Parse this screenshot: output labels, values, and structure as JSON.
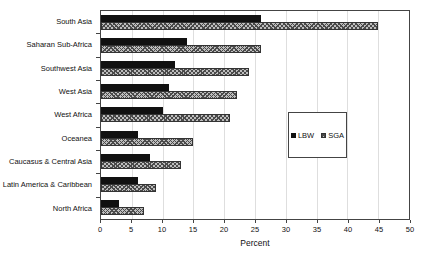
{
  "chart_data": {
    "type": "bar",
    "orientation": "horizontal",
    "categories": [
      "South Asia",
      "Saharan Sub-Africa",
      "Southwest Asia",
      "West Asia",
      "West Africa",
      "Oceanea",
      "Caucasus & Central Asia",
      "Latin America & Caribbean",
      "North Africa"
    ],
    "series": [
      {
        "name": "LBW",
        "style": "solid-black",
        "values": [
          26,
          14,
          12,
          11,
          10,
          6,
          8,
          6,
          3
        ]
      },
      {
        "name": "SGA",
        "style": "crosshatch-gray",
        "values": [
          45,
          26,
          24,
          22,
          21,
          15,
          13,
          9,
          7
        ]
      }
    ],
    "xlabel": "Percent",
    "xlim": [
      0,
      50
    ],
    "xticks": [
      0,
      5,
      10,
      15,
      20,
      25,
      30,
      35,
      40,
      45,
      50
    ],
    "grid": "vertical",
    "legend_position": "inside-center-right"
  },
  "colors": {
    "lbw_bar": "#111111",
    "sga_fill": "#bdbdbd",
    "sga_hatch": "#4a4a4a",
    "axis": "#444444",
    "gridline": "#dedede",
    "background": "#ffffff"
  }
}
